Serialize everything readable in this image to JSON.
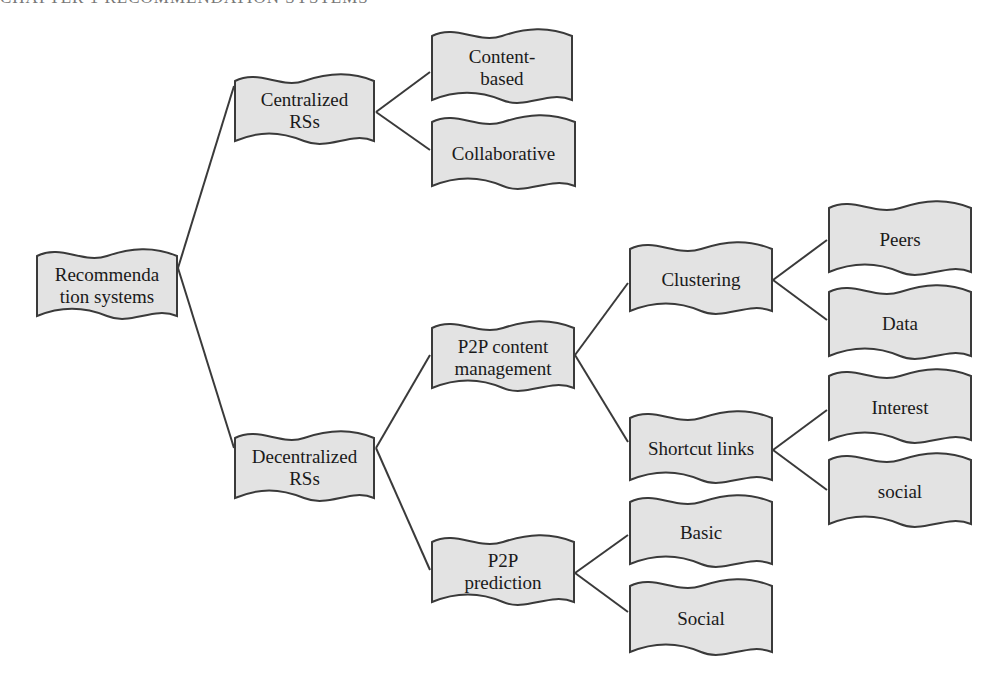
{
  "header": {
    "text": "CHAPTER 1 RECOMMENDATION SYSTEMS"
  },
  "colors": {
    "node_fill": "#e3e3e3",
    "node_stroke": "#3a3a3a",
    "edge": "#3a3a3a",
    "text": "#1a1a1a"
  },
  "nodes": {
    "root": {
      "line1": "Recommenda",
      "line2": "tion systems"
    },
    "centralized": {
      "line1": "Centralized",
      "line2": "RSs"
    },
    "content": {
      "line1": "Content-",
      "line2": "based"
    },
    "collab": {
      "line1": "Collaborative"
    },
    "decentral": {
      "line1": "Decentralized",
      "line2": "RSs"
    },
    "p2pcm": {
      "line1": "P2P content",
      "line2": "management"
    },
    "p2ppred": {
      "line1": "P2P",
      "line2": "prediction"
    },
    "clustering": {
      "line1": "Clustering"
    },
    "shortcut": {
      "line1": "Shortcut links"
    },
    "peers": {
      "line1": "Peers"
    },
    "data": {
      "line1": "Data"
    },
    "interest": {
      "line1": "Interest"
    },
    "social_lower": {
      "line1": "social"
    },
    "basic": {
      "line1": "Basic"
    },
    "social": {
      "line1": "Social"
    }
  }
}
